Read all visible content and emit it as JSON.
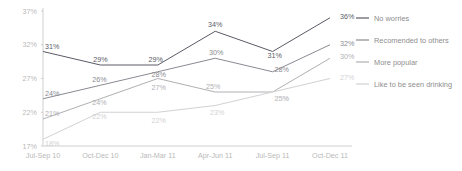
{
  "chart_data": {
    "type": "line",
    "title": "",
    "subtitle": "",
    "xlabel": "",
    "ylabel": "",
    "categories": [
      "Jul-Sep 10",
      "Oct-Dec 10",
      "Jan-Mar 11",
      "Apr-Jun 11",
      "Jul-Sep 11",
      "Oct-Dec 11"
    ],
    "ylim": [
      17,
      37
    ],
    "yticks": [
      "17%",
      "22%",
      "27%",
      "32%",
      "37%"
    ],
    "ytick_values": [
      17,
      22,
      27,
      32,
      37
    ],
    "grid": false,
    "legend_position": "right",
    "value_suffix": "%",
    "series": [
      {
        "name": "No worries",
        "color": "#5a5a66",
        "values": [
          31,
          29,
          29,
          34,
          31,
          36
        ],
        "labels": [
          "31%",
          "29%",
          "29%",
          "34%",
          "31%",
          "36%"
        ]
      },
      {
        "name": "Recomended to others",
        "color": "#8a8a92",
        "values": [
          24,
          26,
          28,
          30,
          28,
          32
        ],
        "labels": [
          "24%",
          "26%",
          "28%",
          "30%",
          "28%",
          "32%"
        ]
      },
      {
        "name": "More popular",
        "color": "#b0b0b4",
        "values": [
          21,
          24,
          27,
          25,
          25,
          30
        ],
        "labels": [
          "21%",
          "24%",
          "27%",
          "25%",
          "25%",
          "30%"
        ]
      },
      {
        "name": "Like to be seen drinking",
        "color": "#d2d2d4",
        "values": [
          18,
          22,
          22,
          23,
          25,
          27
        ],
        "labels": [
          "18%",
          "22%",
          "22%",
          "23%",
          "25%",
          "27%"
        ]
      }
    ]
  },
  "legend": {
    "items": [
      {
        "label": "No worries"
      },
      {
        "label": "Recomended to others"
      },
      {
        "label": "More popular"
      },
      {
        "label": "Like to be seen drinking"
      }
    ]
  },
  "axis": {
    "y_tick_labels": [
      "37%",
      "32%",
      "27%",
      "22%",
      "17%"
    ],
    "x_tick_labels": [
      "Jul-Sep 10",
      "Oct-Dec 10",
      "Jan-Mar 11",
      "Apr-Jun 11",
      "Jul-Sep 11",
      "Oct-Dec 11"
    ]
  }
}
